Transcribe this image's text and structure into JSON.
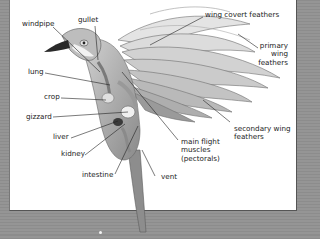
{
  "diagram": {
    "colors": {
      "background": "#8f8f8f",
      "panel": "#ffffff",
      "leader_line": "#222222",
      "label_text": "#222222"
    },
    "labels": {
      "windpipe": "windpipe",
      "gullet": "gullet",
      "lung": "lung",
      "crop": "crop",
      "gizzard": "gizzard",
      "liver": "liver",
      "kidney": "kidney",
      "intestine": "intestine",
      "vent": "vent",
      "main_flight_muscles_1": "main flight",
      "main_flight_muscles_2": "muscles",
      "main_flight_muscles_3": "(pectorals)",
      "secondary_1": "secondary wing",
      "secondary_2": "feathers",
      "primary_1": "primary",
      "primary_2": "wing",
      "primary_3": "feathers",
      "wing_covert": "wing covert feathers"
    }
  }
}
